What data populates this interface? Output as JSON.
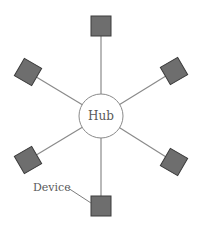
{
  "diagram": {
    "type": "star-topology",
    "hub": {
      "label": "Hub",
      "cx": 101,
      "cy": 116,
      "r": 22
    },
    "devices": [
      {
        "id": "top",
        "cx": 101,
        "cy": 26,
        "rotate": 0
      },
      {
        "id": "upper-right",
        "cx": 174,
        "cy": 71,
        "rotate": -30
      },
      {
        "id": "lower-right",
        "cx": 174,
        "cy": 162,
        "rotate": 30
      },
      {
        "id": "bottom",
        "cx": 101,
        "cy": 206,
        "rotate": 0
      },
      {
        "id": "lower-left",
        "cx": 28,
        "cy": 160,
        "rotate": -30
      },
      {
        "id": "upper-left",
        "cx": 28,
        "cy": 72,
        "rotate": 30
      }
    ],
    "device_label": {
      "text": "Device",
      "x": 33,
      "y": 191,
      "points_to": "bottom"
    },
    "colors": {
      "device_fill": "#6e6e6e",
      "device_stroke": "#3c3c3c",
      "line": "#8a8a8a",
      "hub_stroke": "#8a8a8a",
      "text": "#5a5a5a"
    }
  }
}
